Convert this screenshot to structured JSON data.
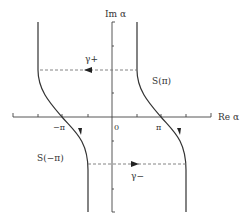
{
  "diagram": {
    "type": "complex-plane-contour",
    "colors": {
      "line": "#333333",
      "dashed": "#777777",
      "background": "#ffffff"
    },
    "axes": {
      "imag_label": "Im α",
      "real_label": "Re α",
      "origin_label": "0",
      "minus_pi_label": "−π",
      "pi_label": "π"
    },
    "curves": [
      {
        "id": "S-pi",
        "label": "S(π)",
        "direction": "downward"
      },
      {
        "id": "S-minus-pi",
        "label": "S(−π)",
        "direction": "downward"
      }
    ],
    "paths": [
      {
        "id": "gamma-plus",
        "label": "γ+",
        "style": "dashed",
        "direction": "left"
      },
      {
        "id": "gamma-minus",
        "label": "γ−",
        "style": "dashed",
        "direction": "right"
      }
    ]
  }
}
